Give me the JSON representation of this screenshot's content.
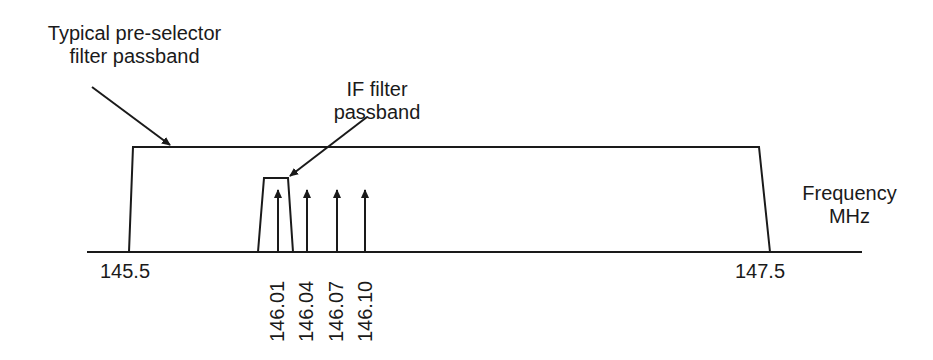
{
  "labels": {
    "preselector_line1": "Typical pre-selector",
    "preselector_line2": "filter passband",
    "if_line1": "IF filter",
    "if_line2": "passband",
    "axis_line1": "Frequency",
    "axis_line2": "MHz"
  },
  "ticks": {
    "left": "145.5",
    "right": "147.5"
  },
  "signals": [
    "146.01",
    "146.04",
    "146.07",
    "146.10"
  ],
  "colors": {
    "ink": "#1a1a1a",
    "background": "#ffffff"
  }
}
